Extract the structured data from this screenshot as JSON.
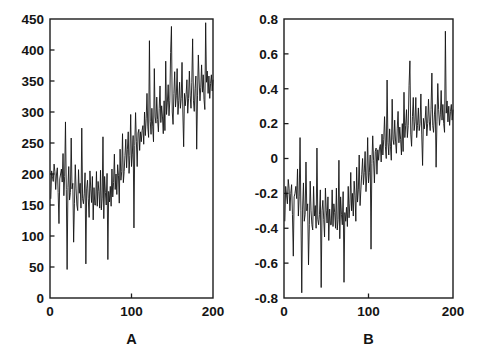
{
  "figure": {
    "background_color": "#ffffff",
    "line_color": "#141414",
    "axis_color": "#1c1c1c",
    "panel_count": 2
  },
  "chart_data": [
    {
      "type": "line",
      "panel_id": "A",
      "title": "",
      "xlabel": "A",
      "ylabel": "",
      "xlim": [
        0,
        200
      ],
      "ylim": [
        0,
        450
      ],
      "xticks": [
        0,
        100,
        200
      ],
      "xticklabels": [
        "0",
        "100",
        "200"
      ],
      "yticks": [
        0,
        50,
        100,
        150,
        200,
        250,
        300,
        350,
        400,
        450
      ],
      "yticklabels": [
        "0",
        "50",
        "100",
        "150",
        "200",
        "250",
        "300",
        "350",
        "400",
        "450"
      ],
      "grid": false,
      "legend": null,
      "series": [
        {
          "name": "A",
          "x_start": 1,
          "x_step": 1,
          "values": [
            160,
            205,
            196,
            188,
            216,
            204,
            175,
            200,
            210,
            170,
            120,
            192,
            200,
            208,
            187,
            233,
            165,
            196,
            284,
            175,
            46,
            178,
            212,
            158,
            170,
            258,
            176,
            185,
            90,
            152,
            215,
            176,
            150,
            141,
            207,
            169,
            185,
            145,
            274,
            160,
            152,
            168,
            202,
            55,
            176,
            190,
            160,
            130,
            205,
            176,
            154,
            196,
            126,
            178,
            150,
            150,
            204,
            148,
            188,
            172,
            145,
            206,
            142,
            161,
            260,
            128,
            196,
            170,
            150,
            201,
            62,
            172,
            155,
            180,
            148,
            208,
            163,
            186,
            232,
            175,
            200,
            167,
            215,
            198,
            153,
            240,
            190,
            204,
            265,
            186,
            204,
            230,
            256,
            210,
            240,
            268,
            201,
            230,
            296,
            212,
            232,
            262,
            113,
            246,
            299,
            252,
            212,
            266,
            272,
            238,
            268,
            252,
            270,
            278,
            248,
            300,
            262,
            289,
            330,
            276,
            259,
            415,
            285,
            264,
            306,
            276,
            252,
            370,
            292,
            282,
            324,
            288,
            268,
            306,
            342,
            283,
            310,
            292,
            265,
            318,
            270,
            382,
            296,
            316,
            344,
            294,
            318,
            396,
            438,
            300,
            280,
            330,
            365,
            308,
            326,
            370,
            296,
            318,
            348,
            306,
            322,
            380,
            300,
            244,
            330,
            310,
            328,
            352,
            298,
            322,
            366,
            326,
            306,
            348,
            418,
            318,
            301,
            338,
            358,
            240,
            326,
            392,
            350,
            318,
            340,
            376,
            332,
            360,
            320,
            304,
            444,
            348,
            366,
            330,
            358,
            322,
            346,
            360,
            334,
            352
          ]
        }
      ]
    },
    {
      "type": "line",
      "panel_id": "B",
      "title": "",
      "xlabel": "B",
      "ylabel": "",
      "xlim": [
        0,
        200
      ],
      "ylim": [
        -0.8,
        0.8
      ],
      "xticks": [
        0,
        100,
        200
      ],
      "xticklabels": [
        "0",
        "100",
        "200"
      ],
      "yticks": [
        -0.8,
        -0.6,
        -0.4,
        -0.2,
        0,
        0.2,
        0.4,
        0.6,
        0.8
      ],
      "yticklabels": [
        "-0.8",
        "-0.6",
        "-0.4",
        "-0.2",
        "0",
        "0.2",
        "0.4",
        "0.6",
        "0.8"
      ],
      "grid": false,
      "legend": null,
      "series": [
        {
          "name": "B",
          "x_start": 1,
          "x_step": 1,
          "values": [
            -0.36,
            -0.16,
            -0.21,
            -0.26,
            -0.12,
            -0.17,
            -0.3,
            -0.2,
            -0.15,
            -0.32,
            -0.56,
            -0.22,
            -0.2,
            -0.16,
            -0.23,
            -0.06,
            -0.33,
            -0.22,
            0.12,
            -0.3,
            -0.77,
            -0.29,
            -0.14,
            -0.36,
            -0.32,
            -0.02,
            -0.3,
            -0.26,
            -0.61,
            -0.38,
            -0.13,
            -0.3,
            -0.38,
            -0.41,
            -0.16,
            -0.33,
            -0.27,
            -0.4,
            0.06,
            -0.35,
            -0.38,
            -0.32,
            -0.18,
            -0.74,
            -0.3,
            -0.24,
            -0.35,
            -0.45,
            -0.17,
            -0.3,
            -0.37,
            -0.22,
            -0.47,
            -0.29,
            -0.38,
            -0.38,
            -0.18,
            -0.39,
            -0.26,
            -0.31,
            -0.4,
            -0.17,
            -0.41,
            -0.35,
            -0.01,
            -0.46,
            -0.22,
            -0.32,
            -0.38,
            -0.19,
            -0.71,
            -0.31,
            -0.36,
            -0.28,
            -0.39,
            -0.16,
            -0.34,
            -0.26,
            -0.08,
            -0.3,
            -0.2,
            -0.33,
            -0.13,
            -0.21,
            -0.36,
            -0.05,
            -0.25,
            -0.18,
            0.02,
            -0.27,
            -0.18,
            -0.09,
            0.0,
            -0.15,
            -0.08,
            0.04,
            -0.19,
            -0.1,
            0.12,
            -0.14,
            -0.08,
            0.02,
            -0.52,
            -0.03,
            0.13,
            -0.01,
            -0.14,
            0.04,
            0.06,
            -0.09,
            0.05,
            -0.01,
            0.06,
            0.08,
            -0.02,
            0.14,
            0.02,
            0.11,
            0.24,
            0.07,
            0.0,
            0.45,
            0.09,
            0.02,
            0.17,
            0.07,
            -0.01,
            0.34,
            0.11,
            0.08,
            0.22,
            0.1,
            0.03,
            0.17,
            0.27,
            0.09,
            0.18,
            0.11,
            0.02,
            0.2,
            0.04,
            0.38,
            0.12,
            0.19,
            0.28,
            0.12,
            0.19,
            0.42,
            0.56,
            0.14,
            0.07,
            0.24,
            0.35,
            0.16,
            0.21,
            0.35,
            0.12,
            0.19,
            0.29,
            0.16,
            0.2,
            0.37,
            0.14,
            -0.04,
            0.23,
            0.17,
            0.22,
            0.3,
            0.13,
            0.2,
            0.34,
            0.21,
            0.16,
            0.28,
            0.49,
            0.19,
            0.15,
            0.25,
            0.31,
            -0.05,
            0.21,
            0.43,
            0.28,
            0.19,
            0.25,
            0.39,
            0.22,
            0.31,
            0.2,
            0.15,
            0.73,
            0.26,
            0.33,
            0.21,
            0.3,
            0.19,
            0.27,
            0.31,
            0.22,
            0.28
          ]
        }
      ]
    }
  ]
}
